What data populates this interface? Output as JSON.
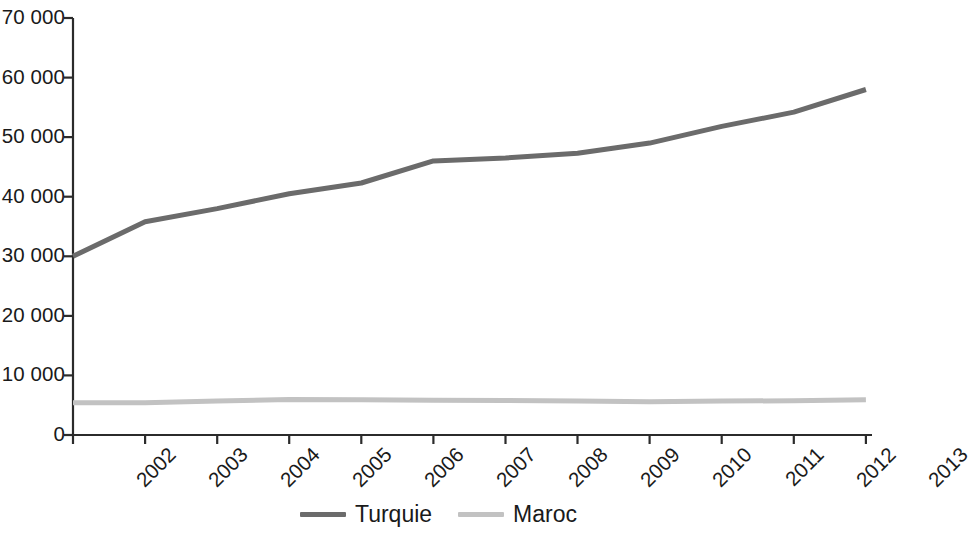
{
  "chart_data": {
    "type": "line",
    "title": "",
    "subtitle": "",
    "xlabel": "",
    "ylabel": "",
    "categories": [
      "2002",
      "2003",
      "2004",
      "2005",
      "2006",
      "2007",
      "2008",
      "2009",
      "2010",
      "2011",
      "2012",
      "2013"
    ],
    "series": [
      {
        "name": "Turquie",
        "color": "#6b6b6b",
        "values": [
          30000,
          35800,
          38000,
          40500,
          42300,
          46000,
          46500,
          47300,
          49000,
          51800,
          54200,
          58000
        ]
      },
      {
        "name": "Maroc",
        "color": "#c2c2c2",
        "values": [
          5400,
          5400,
          5700,
          5950,
          5900,
          5850,
          5800,
          5700,
          5600,
          5700,
          5750,
          5900
        ]
      }
    ],
    "xlim": [
      2002,
      2013
    ],
    "ylim": [
      0,
      70000
    ],
    "y_ticks": [
      0,
      10000,
      20000,
      30000,
      40000,
      50000,
      60000,
      70000
    ],
    "y_tick_labels": [
      "0",
      "10 000",
      "20 000",
      "30 000",
      "40 000",
      "50 000",
      "60 000",
      "70 000"
    ],
    "x_tick_labels": [
      "2002",
      "2003",
      "2004",
      "2005",
      "2006",
      "2007",
      "2008",
      "2009",
      "2010",
      "2011",
      "2012",
      "2013"
    ],
    "grid": false,
    "legend_position": "bottom-center",
    "axis_color": "#2b2b2b",
    "background": "#ffffff"
  },
  "legend": {
    "entries": [
      {
        "label": "Turquie",
        "color": "#6b6b6b"
      },
      {
        "label": "Maroc",
        "color": "#c2c2c2"
      }
    ]
  },
  "y_axis": {
    "labels": [
      "70 000",
      "60 000",
      "50 000",
      "40 000",
      "30 000",
      "20 000",
      "10 000",
      "0"
    ]
  },
  "x_axis": {
    "labels": [
      "2002",
      "2003",
      "2004",
      "2005",
      "2006",
      "2007",
      "2008",
      "2009",
      "2010",
      "2011",
      "2012",
      "2013"
    ]
  }
}
